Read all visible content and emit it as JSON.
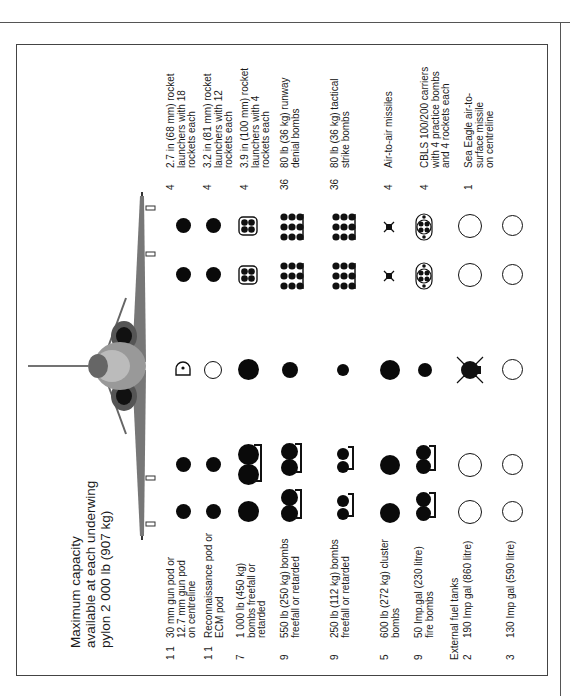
{
  "title": {
    "line1": "Maximum capacity",
    "line2": "available at each underwing",
    "line3": "pylon 2 000 lb (907 kg)"
  },
  "left_loads": [
    {
      "qty": "1\n1",
      "desc": "30 mm gun pod or\n12.7 mm gun pod\non centreline"
    },
    {
      "qty": "1\n1",
      "desc": "Reconnaissance pod or\nECM pod"
    },
    {
      "qty": "7",
      "desc": "1 000 lb (450 kg)\nbombs freefall or\nretarded"
    },
    {
      "qty": "9",
      "desc": "550 lb (250 kg) bombs\nfreefall or retarded"
    },
    {
      "qty": "9",
      "desc": "250 lb (112 kg) bombs\nfreefall or retarded"
    },
    {
      "qty": "5",
      "desc": "600 lb (272 kg) cluster\nbombs"
    },
    {
      "qty": "9",
      "desc": "50 Imp.gal (230 litre)\nfire bombs"
    },
    {
      "qty": "",
      "desc": "External fuel tanks"
    },
    {
      "qty": "2",
      "desc": "190 Imp gal (860 litre)"
    },
    {
      "qty": "3",
      "desc": "130 Imp gal (590 litre)"
    }
  ],
  "right_loads": [
    {
      "qty": "4",
      "desc": "2.7 in (68 mm) rocket\nlaunchers with 18\nrockets each"
    },
    {
      "qty": "4",
      "desc": "3.2 in (81 mm) rocket\nlaunchers with 12\nrockets each"
    },
    {
      "qty": "4",
      "desc": "3.9 in (100 mm) rocket\nlaunchers with 4\nrockets each"
    },
    {
      "qty": "36",
      "desc": "80 lb (36 kg) runway\ndenial bombs"
    },
    {
      "qty": "36",
      "desc": "80 lb (36 kg) tactical\nstrike bombs"
    },
    {
      "qty": "4",
      "desc": "Air-to-air missiles"
    },
    {
      "qty": "4",
      "desc": "CBLS 100/200 carriers\nwith 4 practice bombs\nand 4 rockets each"
    },
    {
      "qty": "1",
      "desc": "Sea Eagle air-to-\nsurface missile\non centreline"
    }
  ],
  "icons": {
    "aircraft": "harrier-front-view-icon",
    "solid_store": "filled-circle",
    "hollow_store": "open-circle",
    "gun_pod": "half-circle-pod",
    "rocket_pod_4": "quad-rocket-launcher",
    "cluster_rack": "multi-bomb-rack",
    "cbls": "cbls-carrier",
    "missile": "aam-x",
    "sea_eagle": "sea-eagle-cross"
  },
  "colors": {
    "ink": "#0a0a0a",
    "frame": "#444444",
    "paper": "#ffffff"
  }
}
